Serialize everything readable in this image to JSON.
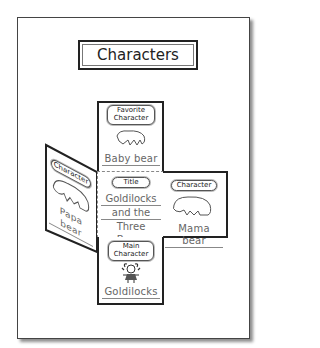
{
  "page": {
    "title": "Characters"
  },
  "panels": {
    "top": {
      "label_line1": "Favorite",
      "label_line2": "Character",
      "name": "Baby bear",
      "icon": "bear-icon"
    },
    "left": {
      "label": "Character",
      "name": "Papa bear",
      "icon": "bear-icon"
    },
    "center": {
      "label": "Title",
      "lines": [
        "Goldilocks",
        "and the",
        "Three Bears"
      ]
    },
    "right": {
      "label": "Character",
      "name": "Mama bear",
      "icon": "bear-icon"
    },
    "bottom": {
      "label_line1": "Main",
      "label_line2": "Character",
      "name": "Goldilocks",
      "icon": "girl-icon"
    }
  },
  "colors": {
    "border": "#222222",
    "dashed": "#888888",
    "text": "#666666"
  }
}
